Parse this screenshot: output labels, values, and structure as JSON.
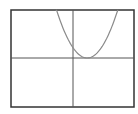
{
  "chart_data": {
    "type": "line",
    "title": "",
    "xlabel": "",
    "ylabel": "",
    "xlim": [
      -10,
      10
    ],
    "ylim": [
      -10,
      10
    ],
    "grid": false,
    "axes_visible": true,
    "series": [
      {
        "name": "parabola",
        "equation": "y = a(x - h)^2",
        "vertex": [
          2.3,
          0
        ],
        "opens": "up",
        "color": "#8a8a8a",
        "x": [
          -2.8,
          -2,
          -1,
          0,
          1,
          2.3,
          3.5,
          4.5,
          5.5,
          6.6,
          7.3
        ],
        "y": [
          10,
          7.9,
          4.6,
          2.3,
          0.7,
          0,
          0.6,
          2.1,
          4.4,
          7.9,
          10
        ]
      }
    ]
  },
  "colors": {
    "frame": "#333333",
    "axes": "#555555",
    "curve": "#8a8a8a",
    "background": "#ffffff"
  }
}
